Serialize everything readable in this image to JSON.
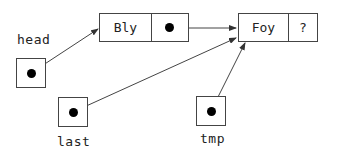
{
  "diagram": {
    "type": "linked-list-pointer-diagram",
    "nodes": [
      {
        "id": "bly",
        "data": "Bly",
        "next": "pointer-to-foy"
      },
      {
        "id": "foy",
        "data": "Foy",
        "next": "?"
      }
    ],
    "variables": [
      {
        "id": "head",
        "label": "head",
        "points_to": "bly"
      },
      {
        "id": "last",
        "label": "last",
        "points_to": "foy"
      },
      {
        "id": "tmp",
        "label": "tmp",
        "points_to": "foy"
      }
    ]
  },
  "labels": {
    "head": "head",
    "last": "last",
    "tmp": "tmp",
    "bly_data": "Bly",
    "foy_data": "Foy",
    "foy_next": "?"
  },
  "colors": {
    "line": "#444444",
    "dot": "#000000",
    "background": "#ffffff"
  }
}
